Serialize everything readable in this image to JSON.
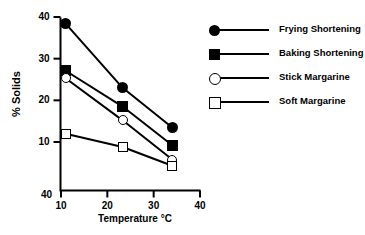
{
  "chart_data": {
    "type": "line",
    "title": "",
    "xlabel": "Temperature  °C",
    "ylabel": "% Solids",
    "xlim": [
      5,
      42.5
    ],
    "ylim": [
      2,
      41
    ],
    "grid": false,
    "legend_position": "right",
    "x_ticks": [
      "10",
      "20",
      "30",
      "40"
    ],
    "x_tick_values": [
      10,
      20,
      30,
      40
    ],
    "y_ticks": [
      "40",
      "30",
      "20",
      "10"
    ],
    "y_tick_values": [
      40,
      30,
      20,
      10
    ],
    "corner_label": "40",
    "x": [
      11,
      23.3,
      34
    ],
    "series": [
      {
        "name": "Frying Shortening",
        "marker": "circle-filled",
        "values": [
          38.4,
          23.0,
          13.5
        ]
      },
      {
        "name": "Baking Shortening",
        "marker": "square-filled",
        "values": [
          27.1,
          18.5,
          9.2
        ]
      },
      {
        "name": "Stick Margarine",
        "marker": "circle-open",
        "values": [
          25.3,
          15.2,
          5.8
        ]
      },
      {
        "name": "Soft Margarine",
        "marker": "square-open",
        "values": [
          12.0,
          8.8,
          4.3
        ]
      }
    ]
  }
}
